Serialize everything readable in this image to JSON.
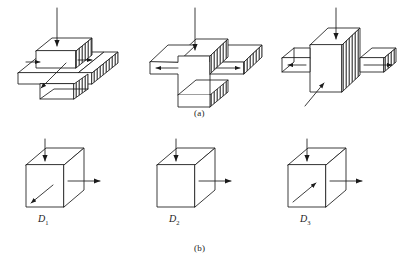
{
  "figure": {
    "title": "",
    "panels": [
      {
        "id": "a",
        "caption": "(a)",
        "items": [
          {
            "name": "slab-with-raised-block",
            "description": "flat plate with raised rectangular block on top",
            "arrows": [
              {
                "name": "load-arrow-down",
                "direction": "down"
              },
              {
                "name": "reaction-arrow-left",
                "direction": "right"
              },
              {
                "name": "reaction-arrow-right",
                "direction": "right"
              },
              {
                "name": "diagonal-arrow",
                "direction": "down-left"
              }
            ],
            "hatched_faces": "right"
          },
          {
            "name": "cross-shaped-solid",
            "description": "plus/cross shaped extruded solid",
            "arrows": [
              {
                "name": "load-arrow-down",
                "direction": "down"
              },
              {
                "name": "arm-arrow-left",
                "direction": "left"
              },
              {
                "name": "arm-arrow-right",
                "direction": "right"
              }
            ],
            "hatched_faces": "right"
          },
          {
            "name": "cube-with-two-arms",
            "description": "central cube with horizontal arms left and right",
            "arrows": [
              {
                "name": "load-arrow-down",
                "direction": "down"
              },
              {
                "name": "arm-arrow-left",
                "direction": "left"
              },
              {
                "name": "arm-arrow-right",
                "direction": "right"
              },
              {
                "name": "diagonal-arrow",
                "direction": "up-right"
              }
            ],
            "hatched_faces": "right"
          }
        ]
      },
      {
        "id": "b",
        "caption": "(b)",
        "items": [
          {
            "name": "cube-d1",
            "label": "D",
            "subscript": "1",
            "arrows": [
              {
                "name": "load-arrow-down",
                "direction": "down"
              },
              {
                "name": "side-arrow-right",
                "direction": "right"
              },
              {
                "name": "diagonal-arrow",
                "direction": "down-left"
              }
            ]
          },
          {
            "name": "cube-d2",
            "label": "D",
            "subscript": "2",
            "arrows": [
              {
                "name": "load-arrow-down",
                "direction": "down"
              },
              {
                "name": "side-arrow-right",
                "direction": "right"
              }
            ]
          },
          {
            "name": "cube-d3",
            "label": "D",
            "subscript": "3",
            "arrows": [
              {
                "name": "load-arrow-down",
                "direction": "down"
              },
              {
                "name": "side-arrow-right",
                "direction": "right"
              },
              {
                "name": "diagonal-arrow",
                "direction": "up-right"
              }
            ]
          }
        ]
      }
    ]
  },
  "style": {
    "line_color": "#1a1a1a",
    "fill_color": "#ffffff",
    "hatch_color": "#3a3a3a",
    "background": "#ffffff"
  }
}
